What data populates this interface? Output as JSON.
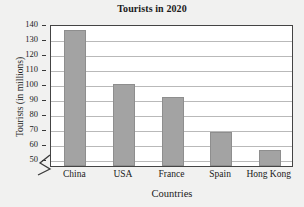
{
  "chart_data": {
    "type": "bar",
    "title": "Tourists in 2020",
    "xlabel": "Countries",
    "ylabel": "Tourists (in millions)",
    "categories": [
      "China",
      "USA",
      "France",
      "Spain",
      "Hong Kong"
    ],
    "values": [
      136,
      100,
      91,
      68,
      56
    ],
    "ylim": [
      45,
      140
    ],
    "yticks": [
      50,
      60,
      70,
      80,
      90,
      100,
      110,
      120,
      130,
      140
    ],
    "ytick_labels": [
      "50",
      "60",
      "70",
      "80",
      "90",
      "100",
      "110",
      "120",
      "130",
      "140"
    ],
    "grid": true,
    "legend": false,
    "axis_break": true,
    "bar_color": "#a3a3a3",
    "plot_background": "#ffffff",
    "figure_background": "#f1f1f0",
    "gridline_color": "#b9b9b9",
    "axis_color": "#444444",
    "text_color": "#1a1a1a"
  }
}
